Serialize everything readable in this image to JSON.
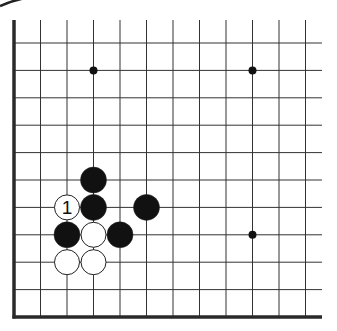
{
  "diagram": {
    "type": "go-board-fragment",
    "grid": {
      "columns": 12,
      "rows": 11,
      "x0": 14,
      "x_step": 26.5,
      "y0": 43,
      "y_step": 27.4,
      "top_open_y": 20,
      "right_open_x": 322,
      "line_color": "#333333",
      "edge_color": "#2a2a2a",
      "edges": [
        "left",
        "bottom"
      ]
    },
    "star_points": [
      {
        "col": 3,
        "row": 1
      },
      {
        "col": 9,
        "row": 1
      },
      {
        "col": 9,
        "row": 7
      }
    ],
    "stones": [
      {
        "color": "black",
        "col": 3,
        "row": 5,
        "label": ""
      },
      {
        "color": "white",
        "col": 2,
        "row": 6,
        "label": "1"
      },
      {
        "color": "black",
        "col": 3,
        "row": 6,
        "label": ""
      },
      {
        "color": "black",
        "col": 5,
        "row": 6,
        "label": ""
      },
      {
        "color": "black",
        "col": 2,
        "row": 7,
        "label": ""
      },
      {
        "color": "white",
        "col": 3,
        "row": 7,
        "label": ""
      },
      {
        "color": "black",
        "col": 4,
        "row": 7,
        "label": ""
      },
      {
        "color": "white",
        "col": 2,
        "row": 8,
        "label": ""
      },
      {
        "color": "white",
        "col": 3,
        "row": 8,
        "label": ""
      }
    ],
    "colors": {
      "black_stone": "#111111",
      "white_stone": "#ffffff",
      "stone_outline": "#222222",
      "background": "#ffffff"
    }
  }
}
